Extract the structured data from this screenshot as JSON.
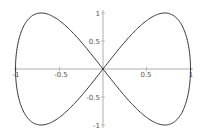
{
  "chart_data": {
    "type": "line",
    "title": "",
    "xlabel": "",
    "ylabel": "",
    "xlim": [
      -1,
      1
    ],
    "ylim": [
      -1,
      1
    ],
    "grid": false,
    "x_ticks": [
      "-1",
      "-0.5",
      "0.5",
      "1"
    ],
    "y_ticks": [
      "1",
      "0.5",
      "-0.5",
      "-1"
    ],
    "series": [
      {
        "name": "curve",
        "parametric": {
          "x": "cos(t)",
          "y": "sin(2t)",
          "t_range": [
            0,
            6.2832
          ]
        },
        "key_points": [
          {
            "x": 1,
            "y": 0
          },
          {
            "x": 0.707,
            "y": 1
          },
          {
            "x": 0,
            "y": 0
          },
          {
            "x": -0.707,
            "y": -1
          },
          {
            "x": -1,
            "y": 0
          },
          {
            "x": -0.707,
            "y": 1
          },
          {
            "x": 0,
            "y": 0
          },
          {
            "x": 0.707,
            "y": -1
          }
        ]
      }
    ],
    "colors": {
      "curve": "#333333",
      "axes": "#888888"
    }
  }
}
